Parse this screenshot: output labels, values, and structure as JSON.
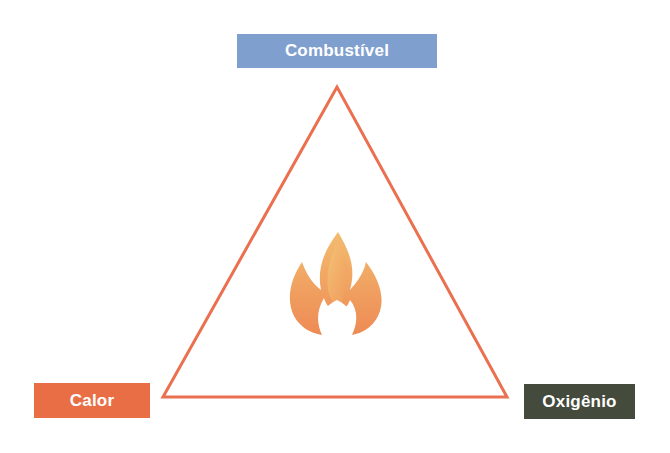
{
  "diagram": {
    "nodes": [
      {
        "id": "top",
        "label": "Combustível",
        "color": "#7f9fcf"
      },
      {
        "id": "left",
        "label": "Calor",
        "color": "#ea6e45"
      },
      {
        "id": "right",
        "label": "Oxigênio",
        "color": "#444a3c"
      }
    ],
    "triangle": {
      "stroke": "#ea7050",
      "points": "337,87 163,397 507,397"
    },
    "center_icon": "flame-icon",
    "flame_colors": {
      "outer": "#ee8a55",
      "inner": "#f3bc6f"
    }
  }
}
